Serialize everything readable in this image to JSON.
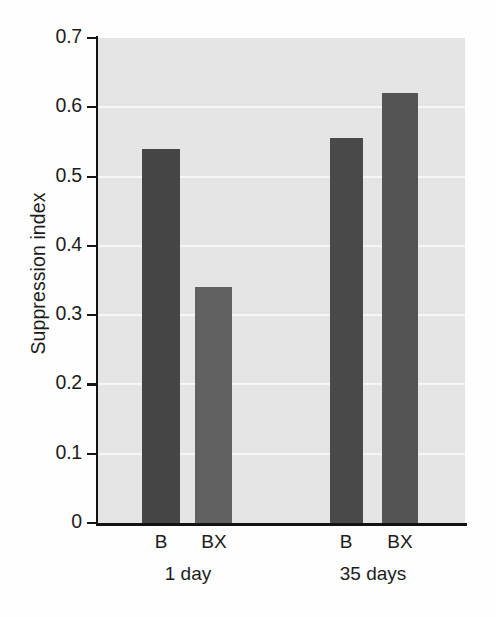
{
  "chart_data": {
    "type": "bar",
    "title": "",
    "subtitle": "",
    "xlabel": "",
    "ylabel": "Suppression index",
    "ylim": [
      0,
      0.7
    ],
    "yticks": [
      "0.7",
      "0.6",
      "0.5",
      "0.4",
      "0.3",
      "0.2",
      "0.1",
      "0"
    ],
    "ytick_values": [
      0.7,
      0.6,
      0.5,
      0.4,
      0.3,
      0.2,
      0.1,
      0
    ],
    "grid": "horizontal",
    "legend": "none",
    "groups": [
      {
        "label": "1 day",
        "bars": [
          {
            "label": "B",
            "value": 0.54,
            "color": "#474747"
          },
          {
            "label": "BX",
            "value": 0.34,
            "color": "#636363"
          }
        ]
      },
      {
        "label": "35 days",
        "bars": [
          {
            "label": "B",
            "value": 0.556,
            "color": "#4b4b4b"
          },
          {
            "label": "BX",
            "value": 0.62,
            "color": "#565656"
          }
        ]
      }
    ],
    "categories": [
      "B (1 day)",
      "BX (1 day)",
      "B (35 days)",
      "BX (35 days)"
    ],
    "values": [
      0.54,
      0.34,
      0.556,
      0.62
    ],
    "colors": {
      "plot_background": "#e9e9e9",
      "gridline": "#fbfbfb",
      "axis": "#121212",
      "text": "#1c1c1c"
    }
  },
  "bars_layout": [
    {
      "name": "bar-b-1day",
      "left": 44,
      "width": 38,
      "value": 0.54
    },
    {
      "name": "bar-bx-1day",
      "left": 97,
      "width": 37,
      "value": 0.34
    },
    {
      "name": "bar-b-35days",
      "left": 232,
      "width": 33,
      "value": 0.556
    },
    {
      "name": "bar-bx-35days",
      "left": 284,
      "width": 36,
      "value": 0.62
    }
  ],
  "x_labels": [
    {
      "text": "B",
      "center": 161
    },
    {
      "text": "BX",
      "center": 214
    },
    {
      "text": "B",
      "center": 346
    },
    {
      "text": "BX",
      "center": 400
    }
  ],
  "x_group_labels": [
    {
      "text": "1 day",
      "center": 188
    },
    {
      "text": "35 days",
      "center": 373
    }
  ]
}
